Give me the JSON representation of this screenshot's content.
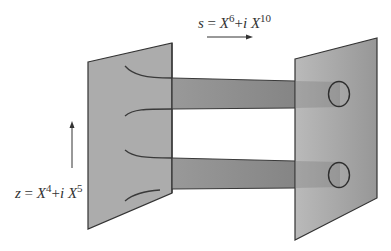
{
  "diagram": {
    "type": "brane-string-diagram",
    "labels": {
      "s": {
        "var": "s",
        "eq": " = ",
        "x1": "X",
        "e1": "6",
        "plus": "+",
        "i": "i",
        "x2": " X",
        "e2": "10",
        "full": "s = X^6 + i X^10"
      },
      "z": {
        "var": "z",
        "eq": " = ",
        "x1": "X",
        "e1": "4",
        "plus": "+",
        "i": "i",
        "x2": " X",
        "e2": "5",
        "full": "z = X^4 + i X^5"
      }
    },
    "arrows": [
      {
        "id": "s-direction",
        "direction": "right"
      },
      {
        "id": "z-direction",
        "direction": "up"
      }
    ],
    "planes": [
      {
        "id": "left-plane",
        "color": "#a9a9a9"
      },
      {
        "id": "right-plane",
        "color": "#9a9a9a"
      }
    ],
    "tubes": [
      {
        "id": "upper-tube",
        "color": "#8c8c8c"
      },
      {
        "id": "lower-tube",
        "color": "#8c8c8c"
      }
    ],
    "circles": [
      {
        "id": "upper-circle"
      },
      {
        "id": "lower-circle"
      }
    ],
    "colors": {
      "stroke": "#333333",
      "background": "#ffffff"
    }
  }
}
